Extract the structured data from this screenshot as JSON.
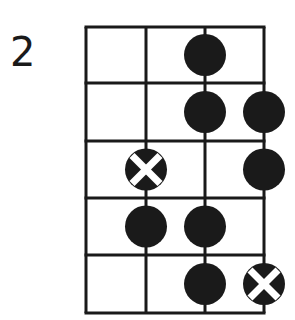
{
  "diagram": {
    "type": "fretboard-scale-diagram",
    "starting_fret_label": "2",
    "strings": 4,
    "frets": 5,
    "colors": {
      "line": "#1a1a1a",
      "dot": "#1a1a1a",
      "root_cross": "#ffffff",
      "background": "#ffffff"
    },
    "dots": [
      {
        "fret": 1,
        "string": 3,
        "root": false
      },
      {
        "fret": 2,
        "string": 3,
        "root": false
      },
      {
        "fret": 2,
        "string": 4,
        "root": false
      },
      {
        "fret": 3,
        "string": 2,
        "root": true
      },
      {
        "fret": 3,
        "string": 4,
        "root": false
      },
      {
        "fret": 4,
        "string": 2,
        "root": false
      },
      {
        "fret": 4,
        "string": 3,
        "root": false
      },
      {
        "fret": 5,
        "string": 3,
        "root": false
      },
      {
        "fret": 5,
        "string": 4,
        "root": true
      }
    ]
  }
}
